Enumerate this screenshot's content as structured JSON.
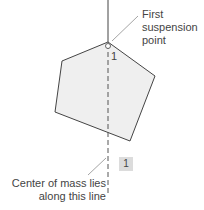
{
  "labels": {
    "suspension": [
      "First",
      "suspension",
      "point"
    ],
    "vertex_number": "1",
    "badge": "1",
    "center_of_mass": [
      "Center of mass lies",
      "along this line"
    ]
  },
  "colors": {
    "fill": "#efefef",
    "stroke": "#444444",
    "badge": "#dcdcdc"
  }
}
